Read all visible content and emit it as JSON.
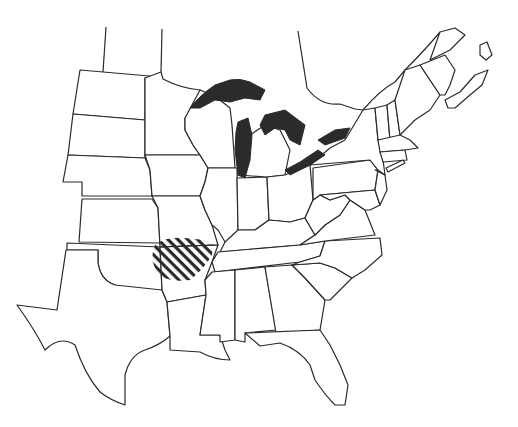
{
  "map": {
    "type": "outline map",
    "region": "Eastern and Central United States with southeastern Canada",
    "colors": {
      "background": "#ffffff",
      "outline": "#2a2a2a",
      "lakes_fill": "#2b2b2b",
      "highlight_hatch": "#2a2a2a"
    },
    "features": [
      {
        "name": "Great Lakes",
        "style": "solid black fill"
      },
      {
        "name": "Highlighted range",
        "style": "diagonal hatching",
        "location": "southwestern Missouri, northwestern Arkansas, northeastern Oklahoma, southeastern Kansas"
      }
    ],
    "labels": []
  }
}
